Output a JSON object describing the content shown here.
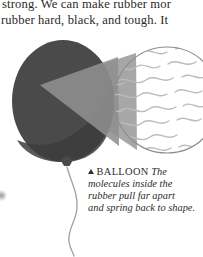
{
  "page": {
    "width": 203,
    "height": 257,
    "background": "#ffffff"
  },
  "body_text": {
    "line1": "strong. We can make rubber mor",
    "line2": "rubber hard, black, and tough. It",
    "color": "#2c2a28"
  },
  "illustration": {
    "name": "balloon-with-magnified-molecule-detail",
    "balloon": {
      "fill": "#4a4a4a",
      "shadow_fill": "#3a3a3a",
      "knot_fill": "#4a4a4a",
      "string_stroke": "#9a9a9a"
    },
    "magnifier_wedge": {
      "fill": "#949494",
      "opacity": "0.85"
    },
    "detail_circle": {
      "fill": "#ffffff",
      "stroke": "#8e8e8e",
      "molecule_stroke": "#b8b8b8",
      "label": "rubber molecules"
    }
  },
  "caption": {
    "marker": "triangle-up",
    "heading": "BALLOON",
    "line1": "The",
    "line2": "molecules inside the",
    "line3": "rubber pull far apart",
    "line4": "and spring back to shape.",
    "color": "#2e2c2a"
  }
}
